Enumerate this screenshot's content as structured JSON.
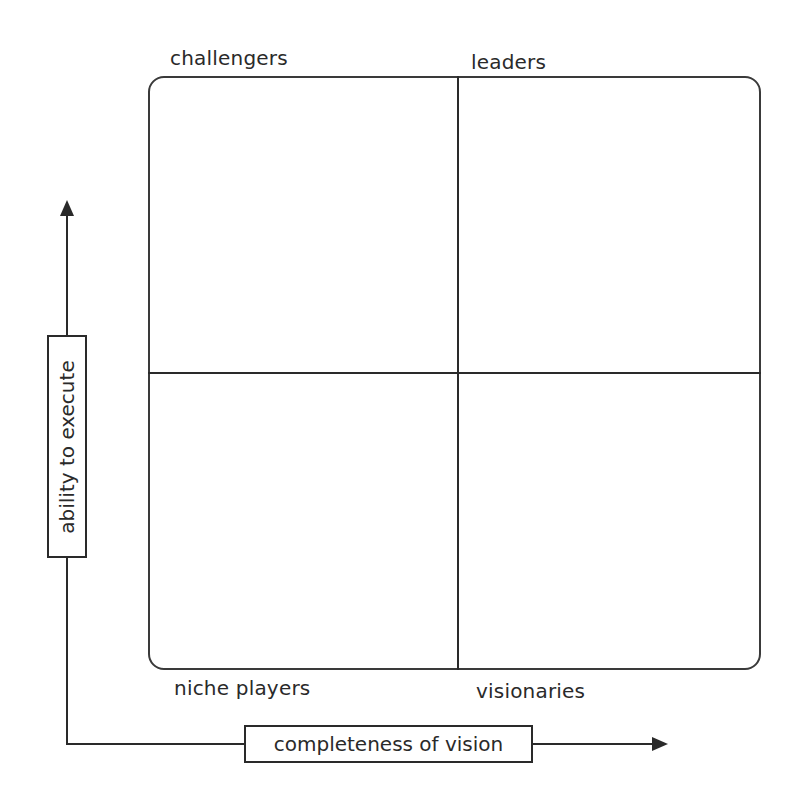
{
  "quadrants": {
    "top_left": "challengers",
    "top_right": "leaders",
    "bottom_left": "niche players",
    "bottom_right": "visionaries"
  },
  "axes": {
    "y_label": "ability to execute",
    "x_label": "completeness of vision"
  },
  "colors": {
    "line": "#2a2a2a",
    "background": "#ffffff"
  }
}
